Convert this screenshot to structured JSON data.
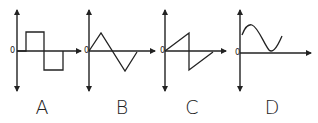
{
  "figure": {
    "panels": [
      {
        "label": "A",
        "origin_label": "0",
        "waveform": "square"
      },
      {
        "label": "B",
        "origin_label": "0",
        "waveform": "triangle"
      },
      {
        "label": "C",
        "origin_label": "0",
        "waveform": "sawtooth"
      },
      {
        "label": "D",
        "origin_label": "0",
        "waveform": "offset-sine"
      }
    ],
    "stroke_color": "#222222",
    "background": "#ffffff"
  }
}
